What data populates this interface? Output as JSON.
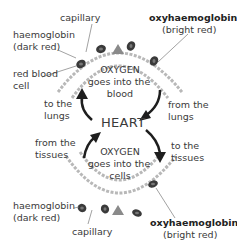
{
  "diagram": {
    "center_label": "HEART",
    "top": {
      "oxygen_title": "OXYGEN",
      "oxygen_line2": "goes into the",
      "oxygen_line3": "blood",
      "capillary": "capillary",
      "haemoglobin_line1": "haemoglobin",
      "haemoglobin_line2": "(dark red)",
      "red_blood_cell_line1": "red blood",
      "red_blood_cell_line2": "cell",
      "oxy_line1": "oxyhaemoglobin",
      "oxy_line2": "(bright red)"
    },
    "left": {
      "to_lungs_line1": "to the",
      "to_lungs_line2": "lungs",
      "from_tissues_line1": "from the",
      "from_tissues_line2": "tissues"
    },
    "right": {
      "from_lungs_line1": "from the",
      "from_lungs_line2": "lungs",
      "to_tissues_line1": "to the",
      "to_tissues_line2": "tissues"
    },
    "bottom": {
      "oxygen_title": "OXYGEN",
      "oxygen_line2": "goes into the",
      "oxygen_line3": "cells",
      "capillary": "capillary",
      "haemoglobin_line1": "haemoglobin",
      "haemoglobin_line2": "(dark red)",
      "oxy_line1": "oxyhaemoglobin",
      "oxy_line2": "(bright red)"
    },
    "colors": {
      "text": "#3a3a3a",
      "arrow": "#1e1e1e",
      "capillary": "#b5b5b5",
      "cell": "#3a3a3a",
      "oxygen_arrow": "#8a8a8a"
    }
  }
}
